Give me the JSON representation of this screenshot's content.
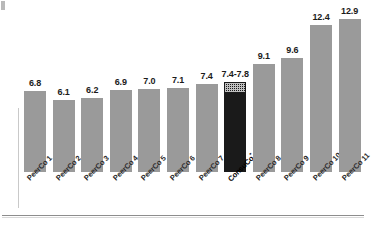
{
  "chart_data": {
    "type": "bar",
    "title": "",
    "subtitle": "",
    "xlabel": "",
    "ylabel": "",
    "grid": false,
    "legend": "none",
    "ylim": [
      0,
      14.5
    ],
    "categories": [
      "PeerCo 1",
      "PeerCo 2",
      "PeerCo 3",
      "PeerCo 4",
      "PeerCo 5",
      "PeerCo 6",
      "PeerCo 7",
      "ConsuCo",
      "PeerCo 8",
      "PeerCo 9",
      "PeerCo 10",
      "PeerCo 11"
    ],
    "values": [
      6.8,
      6.1,
      6.2,
      6.9,
      7.0,
      7.1,
      7.4,
      7.6,
      9.1,
      9.6,
      12.4,
      12.9
    ],
    "data_labels": [
      "6.8",
      "6.1",
      "6.2",
      "6.9",
      "7.0",
      "7.1",
      "7.4",
      "7.4-7.8",
      "9.1",
      "9.6",
      "12.4",
      "12.9"
    ],
    "highlight_index": 7,
    "highlight_range": [
      7.4,
      7.8
    ],
    "highlight_footnote": "*",
    "colors": {
      "bar": "#9a9a9a",
      "highlight_bar": "#1a1a1a",
      "range_cap": "#cfcfcf",
      "label_text": "#1b1b1b",
      "frame": "#8d8d8d",
      "background": "#ffffff"
    }
  }
}
